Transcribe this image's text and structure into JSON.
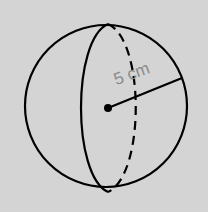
{
  "diagram": {
    "shape": "sphere",
    "radius_label": "5 cm",
    "colors": {
      "background": "#d4d4d4",
      "stroke": "#000000",
      "label": "#8a8a8a"
    }
  }
}
